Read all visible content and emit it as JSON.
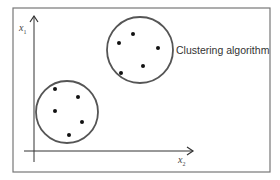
{
  "diagram": {
    "frame": {
      "x": 13,
      "y": 8,
      "width": 257,
      "height": 164,
      "stroke": "#777777"
    },
    "axes": {
      "y_axis": {
        "label": "x",
        "subscript": "1",
        "x": 34,
        "y_top": 16,
        "y_bottom": 162
      },
      "x_axis": {
        "label": "x",
        "subscript": "2",
        "y": 151,
        "x_left": 24,
        "x_right": 193
      },
      "stroke": "#333333"
    },
    "annotation": "Clustering algorithm",
    "clusters": [
      {
        "name": "upper-right-cluster",
        "cx": 140,
        "cy": 50,
        "r": 33,
        "points": [
          [
            133,
            34
          ],
          [
            119,
            43
          ],
          [
            158,
            48
          ],
          [
            121,
            73
          ],
          [
            143,
            66
          ]
        ]
      },
      {
        "name": "lower-left-cluster",
        "cx": 67,
        "cy": 112,
        "r": 31,
        "points": [
          [
            55,
            89
          ],
          [
            78,
            97
          ],
          [
            55,
            111
          ],
          [
            82,
            122
          ],
          [
            69,
            135
          ]
        ]
      }
    ],
    "colors": {
      "circle": "#555555",
      "point": "#111111",
      "background": "#ffffff"
    }
  }
}
